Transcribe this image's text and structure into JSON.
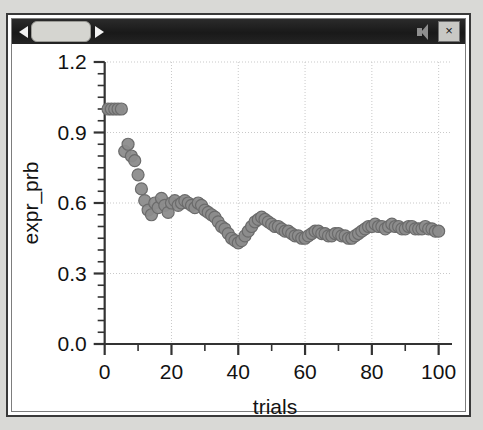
{
  "window": {
    "titlebar": {
      "back_arrow": "left-arrow",
      "forward_arrow": "right-arrow",
      "thumb_label": "",
      "speaker_icon": "speaker-icon",
      "close_label": "×"
    }
  },
  "colors": {
    "marker_fill": "#8c8c8c",
    "marker_stroke": "#6b6b6b",
    "grid": "#c9c9c9",
    "axis": "#333333",
    "titlebar": "#1b1b1b",
    "page_background": "#d9d9d6"
  },
  "chart_data": {
    "type": "scatter",
    "title": "",
    "xlabel": "trials",
    "ylabel": "expr_prb",
    "xlim": [
      -2,
      104
    ],
    "ylim": [
      0.0,
      1.2
    ],
    "xticks": [
      0,
      20,
      40,
      60,
      80,
      100
    ],
    "xtick_labels": [
      "0",
      "20",
      "40",
      "60",
      "80",
      "100"
    ],
    "yticks": [
      0.0,
      0.3,
      0.6,
      0.9,
      1.2
    ],
    "ytick_labels": [
      "0.0",
      "0.3",
      "0.6",
      "0.9",
      "1.2"
    ],
    "x_minor_step": 10,
    "y_minor_step": 0.05,
    "grid": true,
    "grid_style": "dotted",
    "legend": null,
    "marker": "circle",
    "marker_size": 9,
    "series": [
      {
        "name": "expr_prb",
        "x": [
          1,
          2,
          3,
          4,
          5,
          6,
          7,
          8,
          9,
          10,
          11,
          12,
          13,
          14,
          15,
          16,
          17,
          18,
          19,
          20,
          21,
          22,
          23,
          24,
          25,
          26,
          27,
          28,
          29,
          30,
          31,
          32,
          33,
          34,
          35,
          36,
          37,
          38,
          39,
          40,
          41,
          42,
          43,
          44,
          45,
          46,
          47,
          48,
          49,
          50,
          51,
          52,
          53,
          54,
          55,
          56,
          57,
          58,
          59,
          60,
          61,
          62,
          63,
          64,
          65,
          66,
          67,
          68,
          69,
          70,
          71,
          72,
          73,
          74,
          75,
          76,
          77,
          78,
          79,
          80,
          81,
          82,
          83,
          84,
          85,
          86,
          87,
          88,
          89,
          90,
          91,
          92,
          93,
          94,
          95,
          96,
          97,
          98,
          99,
          100
        ],
        "y": [
          1.0,
          1.0,
          1.0,
          1.0,
          1.0,
          0.82,
          0.85,
          0.8,
          0.78,
          0.72,
          0.66,
          0.61,
          0.57,
          0.55,
          0.6,
          0.58,
          0.62,
          0.59,
          0.56,
          0.6,
          0.61,
          0.59,
          0.6,
          0.61,
          0.6,
          0.59,
          0.58,
          0.6,
          0.59,
          0.57,
          0.56,
          0.55,
          0.54,
          0.52,
          0.5,
          0.49,
          0.47,
          0.45,
          0.44,
          0.43,
          0.44,
          0.46,
          0.48,
          0.5,
          0.52,
          0.53,
          0.54,
          0.53,
          0.52,
          0.51,
          0.5,
          0.5,
          0.49,
          0.48,
          0.48,
          0.47,
          0.46,
          0.46,
          0.45,
          0.45,
          0.46,
          0.47,
          0.48,
          0.48,
          0.47,
          0.47,
          0.46,
          0.46,
          0.47,
          0.47,
          0.46,
          0.46,
          0.45,
          0.45,
          0.46,
          0.47,
          0.48,
          0.49,
          0.5,
          0.5,
          0.51,
          0.5,
          0.5,
          0.49,
          0.5,
          0.51,
          0.5,
          0.5,
          0.49,
          0.49,
          0.5,
          0.5,
          0.49,
          0.49,
          0.49,
          0.5,
          0.49,
          0.49,
          0.48,
          0.48
        ]
      }
    ]
  }
}
